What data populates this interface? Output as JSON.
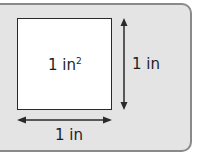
{
  "diagram": {
    "square": {
      "area_label": "1 in",
      "area_exponent": "2"
    },
    "height_label": "1 in",
    "width_label": "1 in"
  },
  "colors": {
    "panel_bg": "#e4e4e4",
    "panel_border": "#8a8a8a",
    "square_fill": "#ffffff",
    "stroke": "#2a2a2a"
  }
}
